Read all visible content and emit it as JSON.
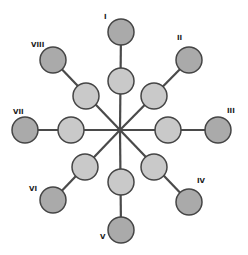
{
  "diagram": {
    "center": {
      "x": 120,
      "y": 130
    },
    "colors": {
      "outer_fill": "#aaaaaa",
      "inner_fill": "#c9c9c9",
      "stroke": "#454545",
      "spoke": "#4a4a4a",
      "label": "#1a1a1a"
    },
    "node_radius": 13,
    "spokes": [
      {
        "label": "I",
        "label_pos": {
          "x": 104,
          "y": 19
        },
        "inner": {
          "x": 121,
          "y": 81
        },
        "outer": {
          "x": 121,
          "y": 32
        }
      },
      {
        "label": "II",
        "label_pos": {
          "x": 177,
          "y": 40
        },
        "inner": {
          "x": 154,
          "y": 96
        },
        "outer": {
          "x": 189,
          "y": 60
        }
      },
      {
        "label": "III",
        "label_pos": {
          "x": 227,
          "y": 113
        },
        "inner": {
          "x": 168,
          "y": 130
        },
        "outer": {
          "x": 218,
          "y": 130
        }
      },
      {
        "label": "IV",
        "label_pos": {
          "x": 197,
          "y": 183
        },
        "inner": {
          "x": 154,
          "y": 167
        },
        "outer": {
          "x": 189,
          "y": 202
        }
      },
      {
        "label": "V",
        "label_pos": {
          "x": 100,
          "y": 239
        },
        "inner": {
          "x": 121,
          "y": 182
        },
        "outer": {
          "x": 121,
          "y": 230
        }
      },
      {
        "label": "VI",
        "label_pos": {
          "x": 29,
          "y": 191
        },
        "inner": {
          "x": 85,
          "y": 167
        },
        "outer": {
          "x": 53,
          "y": 200
        }
      },
      {
        "label": "VII",
        "label_pos": {
          "x": 13,
          "y": 114
        },
        "inner": {
          "x": 71,
          "y": 130
        },
        "outer": {
          "x": 25,
          "y": 130
        }
      },
      {
        "label": "VIII",
        "label_pos": {
          "x": 31,
          "y": 47
        },
        "inner": {
          "x": 86,
          "y": 96
        },
        "outer": {
          "x": 53,
          "y": 60
        }
      }
    ]
  }
}
